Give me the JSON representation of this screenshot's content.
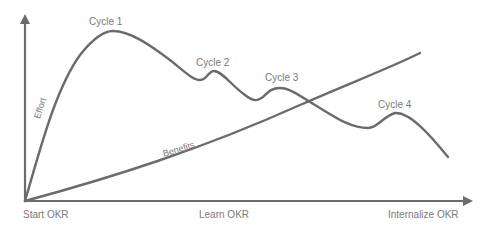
{
  "diagram": {
    "title": "",
    "y_axis_label": "",
    "curves": {
      "effort": {
        "label": "Effort"
      },
      "benefits": {
        "label": "Benefits"
      }
    },
    "cycles": [
      "Cycle 1",
      "Cycle 2",
      "Cycle 3",
      "Cycle 4"
    ],
    "x_labels": {
      "start": "Start OKR",
      "middle": "Learn OKR",
      "end": "Internalize OKR"
    },
    "colors": {
      "line": "#6b6b6b",
      "text": "#7a7a7a",
      "background": "#ffffff"
    }
  }
}
